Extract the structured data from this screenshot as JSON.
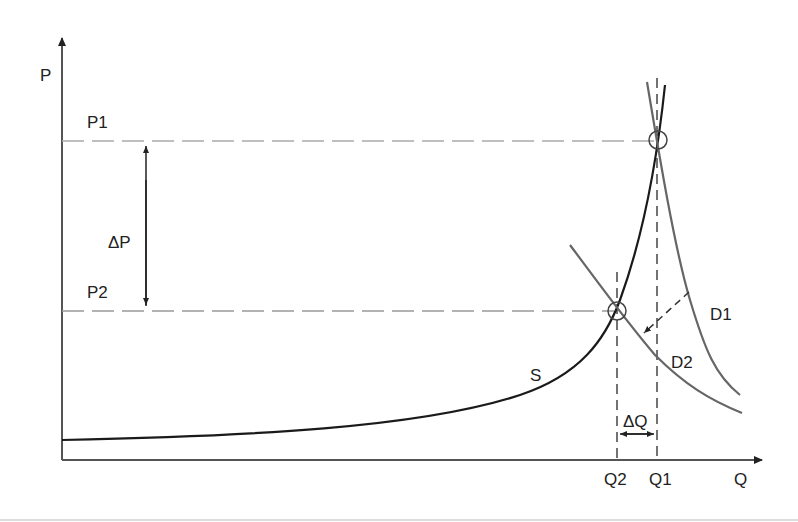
{
  "diagram": {
    "axes": {
      "y_label": "P",
      "x_label": "Q"
    },
    "price_levels": {
      "p1": "P1",
      "p2": "P2",
      "delta_p": "ΔP"
    },
    "quantity_levels": {
      "q1": "Q1",
      "q2": "Q2",
      "delta_q": "ΔQ"
    },
    "curves": {
      "supply": "S",
      "demand1": "D1",
      "demand2": "D2"
    },
    "colors": {
      "axis": "#555555",
      "supply": "#1a1a1a",
      "demand": "#666666",
      "guide": "#999999",
      "text": "#222222"
    }
  }
}
